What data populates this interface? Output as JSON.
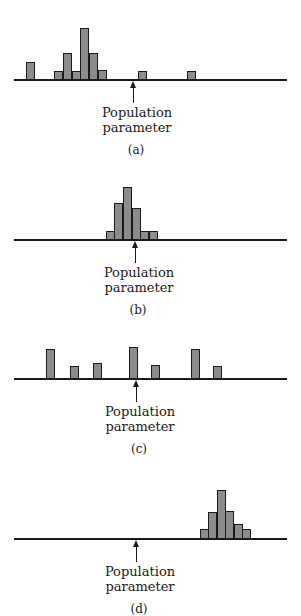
{
  "figure": {
    "param_label_line1": "Population",
    "param_label_line2": "parameter",
    "bar_fill": "#8c8c8c",
    "line_color": "#1a1a1a"
  },
  "panels": [
    {
      "caption": "(a)",
      "baseline_y": 79,
      "arrow_x": 133,
      "bars": [
        {
          "x": 30,
          "h": 17
        },
        {
          "x": 58,
          "h": 8
        },
        {
          "x": 67,
          "h": 26
        },
        {
          "x": 76,
          "h": 8
        },
        {
          "x": 84,
          "h": 51
        },
        {
          "x": 93,
          "h": 26
        },
        {
          "x": 102,
          "h": 9
        },
        {
          "x": 142,
          "h": 8
        },
        {
          "x": 191,
          "h": 8
        }
      ]
    },
    {
      "caption": "(b)",
      "baseline_y": 239,
      "arrow_x": 135,
      "bars": [
        {
          "x": 110,
          "h": 8
        },
        {
          "x": 118,
          "h": 36
        },
        {
          "x": 127,
          "h": 52
        },
        {
          "x": 136,
          "h": 31
        },
        {
          "x": 144,
          "h": 8
        },
        {
          "x": 153,
          "h": 8
        }
      ]
    },
    {
      "caption": "(c)",
      "baseline_y": 378,
      "arrow_x": 136,
      "bars": [
        {
          "x": 50,
          "h": 29
        },
        {
          "x": 74,
          "h": 12
        },
        {
          "x": 97,
          "h": 15
        },
        {
          "x": 133,
          "h": 31
        },
        {
          "x": 155,
          "h": 13
        },
        {
          "x": 195,
          "h": 29
        },
        {
          "x": 217,
          "h": 12
        }
      ]
    },
    {
      "caption": "(d)",
      "baseline_y": 538,
      "arrow_x": 136,
      "bars": [
        {
          "x": 204,
          "h": 9
        },
        {
          "x": 212,
          "h": 26
        },
        {
          "x": 221,
          "h": 48
        },
        {
          "x": 229,
          "h": 27
        },
        {
          "x": 238,
          "h": 14
        },
        {
          "x": 246,
          "h": 9
        }
      ]
    }
  ],
  "chart_data": [
    {
      "type": "bar",
      "title": "(a)",
      "annotation": "Population parameter",
      "x": [
        30,
        58,
        67,
        76,
        84,
        93,
        102,
        142,
        191
      ],
      "values": [
        17,
        8,
        26,
        8,
        51,
        26,
        9,
        8,
        8
      ],
      "xlabel": "",
      "ylabel": "",
      "grid": false
    },
    {
      "type": "bar",
      "title": "(b)",
      "annotation": "Population parameter",
      "x": [
        110,
        118,
        127,
        136,
        144,
        153
      ],
      "values": [
        8,
        36,
        52,
        31,
        8,
        8
      ],
      "xlabel": "",
      "ylabel": "",
      "grid": false
    },
    {
      "type": "bar",
      "title": "(c)",
      "annotation": "Population parameter",
      "x": [
        50,
        74,
        97,
        133,
        155,
        195,
        217
      ],
      "values": [
        29,
        12,
        15,
        31,
        13,
        29,
        12
      ],
      "xlabel": "",
      "ylabel": "",
      "grid": false
    },
    {
      "type": "bar",
      "title": "(d)",
      "annotation": "Population parameter",
      "x": [
        204,
        212,
        221,
        229,
        238,
        246
      ],
      "values": [
        9,
        26,
        48,
        27,
        14,
        9
      ],
      "xlabel": "",
      "ylabel": "",
      "grid": false
    }
  ]
}
